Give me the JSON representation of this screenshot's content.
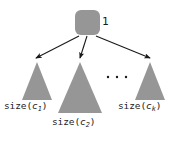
{
  "figure": {
    "type": "tree-diagram",
    "background_color": "#ffffff",
    "shape_fill_color": "#969696",
    "stroke_color": "#1a1a1a",
    "width": 176,
    "height": 141
  },
  "root": {
    "label": "1",
    "shape": "rounded-square",
    "x": 75,
    "y": 10,
    "width": 25,
    "height": 25,
    "corner_radius": 6
  },
  "edges": [
    {
      "from": "root",
      "to": "subtree-0",
      "style": "arrow"
    },
    {
      "from": "root",
      "to": "subtree-1",
      "style": "arrow"
    },
    {
      "from": "root",
      "to": "subtree-2",
      "style": "arrow"
    }
  ],
  "subtrees": [
    {
      "name": "subtree-0",
      "label_prefix": "size(",
      "label_var": "c",
      "label_sub": "1",
      "label_suffix": ")",
      "label_text": "size(c1)",
      "apex_x": 37,
      "apex_y": 62,
      "base_left_x": 22,
      "base_right_x": 52,
      "base_y": 100
    },
    {
      "name": "subtree-1",
      "label_prefix": "size(",
      "label_var": "c",
      "label_sub": "2",
      "label_suffix": ")",
      "label_text": "size(c2)",
      "apex_x": 80,
      "apex_y": 62,
      "base_left_x": 58,
      "base_right_x": 102,
      "base_y": 113
    },
    {
      "name": "subtree-2",
      "label_prefix": "size(",
      "label_var": "c",
      "label_sub": "k",
      "label_suffix": ")",
      "label_text": "size(ck)",
      "apex_x": 150,
      "apex_y": 62,
      "base_left_x": 135,
      "base_right_x": 165,
      "base_y": 100
    }
  ],
  "ellipsis": {
    "label": "· · ·",
    "dot_count": 3,
    "x_positions": [
      108,
      117,
      126
    ],
    "y": 77
  }
}
